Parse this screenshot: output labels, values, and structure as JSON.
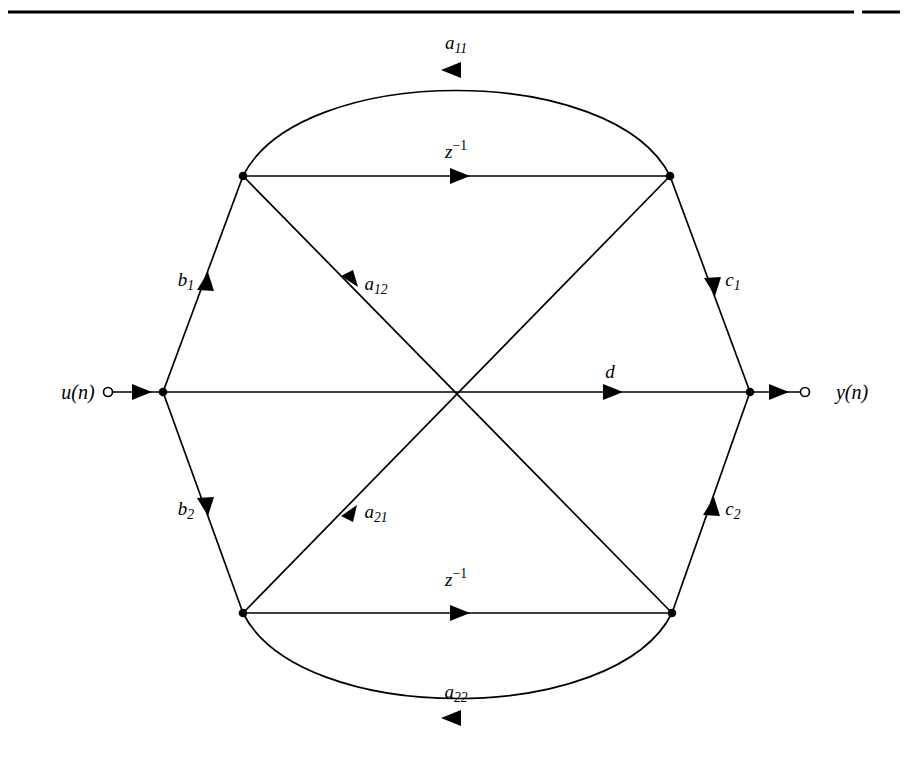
{
  "figure": {
    "type": "signal-flow-graph",
    "background_color": "#ffffff",
    "stroke_color": "#000000",
    "top_rule": {
      "present": true,
      "y": 12,
      "x_start": 8,
      "x_end": 900,
      "gap_start": 854,
      "gap_end": 862,
      "thickness": 3
    }
  },
  "ports": {
    "input": {
      "label": "u(n)",
      "label_x": 78,
      "label_y": 392,
      "terminal_x": 108,
      "terminal_y": 392,
      "node_x": 163,
      "node_y": 392
    },
    "output": {
      "label": "y(n)",
      "label_x": 852,
      "label_y": 392,
      "terminal_x": 805,
      "terminal_y": 392,
      "node_x": 750,
      "node_y": 392
    }
  },
  "nodes": [
    {
      "id": "upper-left",
      "x": 243,
      "y": 176
    },
    {
      "id": "upper-right",
      "x": 670,
      "y": 176
    },
    {
      "id": "lower-left",
      "x": 243,
      "y": 613
    },
    {
      "id": "lower-right",
      "x": 672,
      "y": 613
    },
    {
      "id": "input-sum",
      "x": 163,
      "y": 392
    },
    {
      "id": "output-sum",
      "x": 750,
      "y": 392
    }
  ],
  "edges": {
    "a11": {
      "name": "a11",
      "label_main": "a",
      "label_sub": "11",
      "label_x": 456,
      "label_y": 44,
      "direction": "right-to-left",
      "shape": "arc-above"
    },
    "z_top": {
      "name": "z-inverse-top",
      "label_main": "z",
      "label_sup": "−1",
      "label_x": 456,
      "label_y": 150,
      "direction": "left-to-right",
      "shape": "straight-horizontal"
    },
    "b1": {
      "name": "b1",
      "label_main": "b",
      "label_sub": "1",
      "label_x": 186,
      "label_y": 281,
      "direction": "upward",
      "shape": "straight-diagonal"
    },
    "a12": {
      "name": "a12",
      "label_main": "a",
      "label_sub": "12",
      "label_x": 376,
      "label_y": 285,
      "direction": "up-left",
      "shape": "straight-diagonal"
    },
    "c1": {
      "name": "c1",
      "label_main": "c",
      "label_sub": "1",
      "label_x": 733,
      "label_y": 281,
      "direction": "downward",
      "shape": "straight-diagonal"
    },
    "d": {
      "name": "d",
      "label_main": "d",
      "label_x": 610,
      "label_y": 371,
      "direction": "left-to-right",
      "shape": "straight-horizontal"
    },
    "b2": {
      "name": "b2",
      "label_main": "b",
      "label_sub": "2",
      "label_x": 186,
      "label_y": 510,
      "direction": "downward",
      "shape": "straight-diagonal"
    },
    "a21": {
      "name": "a21",
      "label_main": "a",
      "label_sub": "21",
      "label_x": 376,
      "label_y": 513,
      "direction": "down-left",
      "shape": "straight-diagonal"
    },
    "c2": {
      "name": "c2",
      "label_main": "c",
      "label_sub": "2",
      "label_x": 733,
      "label_y": 510,
      "direction": "up-right",
      "shape": "straight-diagonal"
    },
    "z_bottom": {
      "name": "z-inverse-bottom",
      "label_main": "z",
      "label_sup": "−1",
      "label_x": 456,
      "label_y": 578,
      "direction": "left-to-right",
      "shape": "straight-horizontal"
    },
    "a22": {
      "name": "a22",
      "label_main": "a",
      "label_sub": "22",
      "label_x": 456,
      "label_y": 693,
      "direction": "right-to-left",
      "shape": "arc-below"
    }
  }
}
